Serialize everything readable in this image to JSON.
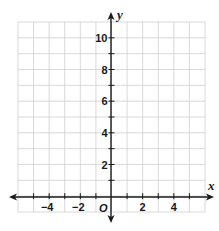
{
  "chart_data": {
    "type": "scatter",
    "title": "",
    "xlabel": "x",
    "ylabel": "y",
    "origin_label": "O",
    "xlim": [
      -6,
      6
    ],
    "ylim": [
      -1,
      11
    ],
    "grid": true,
    "grid_step": 1,
    "x_tick_labels": [
      "-4",
      "-2",
      "2",
      "4"
    ],
    "x_tick_values": [
      -4,
      -2,
      2,
      4
    ],
    "y_tick_labels": [
      "2",
      "4",
      "6",
      "8",
      "10"
    ],
    "y_tick_values": [
      2,
      4,
      6,
      8,
      10
    ],
    "series": [],
    "colors": {
      "grid": "#cfcfcf",
      "axis": "#1a1a1a",
      "background": "#ffffff"
    }
  }
}
